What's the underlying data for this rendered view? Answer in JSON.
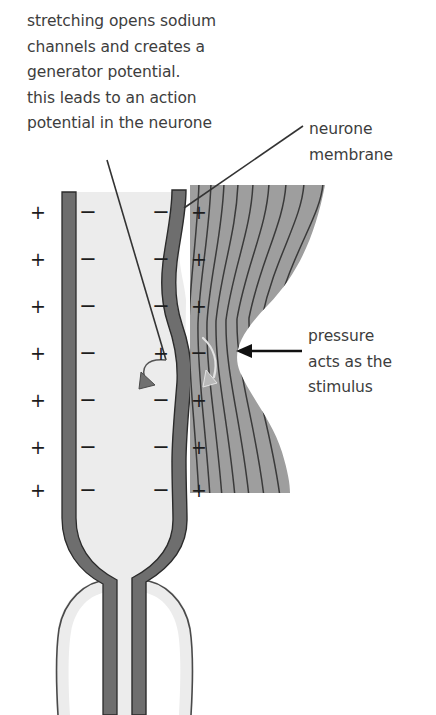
{
  "diagram": {
    "title_text": "stretching opens sodium channels and creates a generator potential. this leads to an action potential in the neurone",
    "intro_caption": "stretching opens sodium\nchannels and creates a\ngenerator potential.\nthis leads to an action\npotential in the neurone",
    "membrane_label": "neurone\nmembrane",
    "pressure_label": "pressure\nacts as the\nstimulus",
    "colors": {
      "background": "#ffffff",
      "membrane": "#6e6e6e",
      "membrane_outline": "#2e2e2e",
      "cytoplasm": "#ececec",
      "lamellae_fill": "#9e9e9e",
      "lamellae_line": "#3a3a3a",
      "text": "#3d3d3d",
      "sign": "#1d1d1d",
      "leader_line": "#333333",
      "white_arrow": "#e8e8e8"
    },
    "charge_columns": [
      {
        "name": "outer-left",
        "position": "outside-left-membrane",
        "x": 38,
        "signs": [
          "+",
          "+",
          "+",
          "+",
          "+",
          "+",
          "+"
        ]
      },
      {
        "name": "inner-left",
        "position": "inside-left-membrane",
        "x": 88,
        "signs": [
          "−",
          "−",
          "−",
          "−",
          "−",
          "−",
          "−"
        ]
      },
      {
        "name": "inner-right",
        "position": "inside-right-membrane",
        "x": 161,
        "signs": [
          "−",
          "−",
          "−",
          "+",
          "−",
          "−",
          "−"
        ]
      },
      {
        "name": "outer-right",
        "position": "outside-right-membrane",
        "x": 199,
        "signs": [
          "+",
          "+",
          "+",
          "−",
          "+",
          "+",
          "+"
        ]
      }
    ],
    "row_y": [
      212,
      259,
      306,
      353,
      400,
      447,
      490
    ],
    "annotations": [
      {
        "name": "generator-potential-leader",
        "from_label": "potential in the neurone",
        "points_to": "depolarised patch of neurone membrane"
      },
      {
        "name": "neurone-membrane-leader",
        "from_label": "neurone membrane",
        "points_to": "right membrane of the neurone"
      },
      {
        "name": "pressure-arrow",
        "from_label": "pressure acts as the stimulus",
        "points_to": "indentation in the lamellae capsule",
        "direction": "left"
      }
    ]
  }
}
